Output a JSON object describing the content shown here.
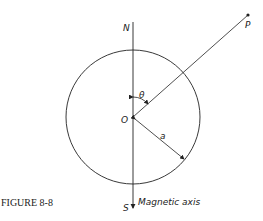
{
  "figure": {
    "caption": "FIGURE 8-8",
    "labels": {
      "north": "N",
      "south": "S",
      "origin": "O",
      "point": "P",
      "angle": "θ",
      "radius": "a",
      "axis": "Magnetic axis"
    }
  }
}
